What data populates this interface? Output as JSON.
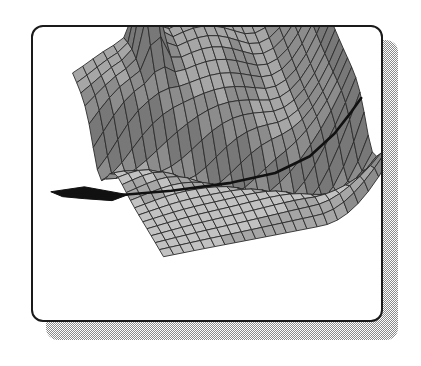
{
  "figure": {
    "kind": "3d-surface-mesh-plot",
    "frame": {
      "shape": "rounded-rectangle",
      "border_color": "#1a1a1a",
      "fill_color": "#ffffff",
      "shadow_color": "#8a8a8a",
      "corner_radius_px": 12
    },
    "canvas": {
      "width_px": 421,
      "height_px": 366
    }
  },
  "chart_data": {
    "type": "surface",
    "title": "",
    "subtitle": "",
    "xlabel": "",
    "ylabel": "",
    "zlabel": "",
    "grid": true,
    "legend": null,
    "axes_visible": false,
    "tick_labels": [],
    "colors": {
      "mesh_line": "#2b2b2b",
      "face_light": "#c2c2c2",
      "face_mid": "#a6a6a6",
      "face_shade": "#8c8c8c",
      "face_dark": "#787878",
      "fold_line": "#111111",
      "background": "#ffffff"
    },
    "projection": {
      "type": "axonometric",
      "rows": 22,
      "cols": 22
    },
    "annotations": [
      {
        "name": "sharp-spike",
        "description": "narrow tall peak on the left-centre ridge",
        "x_px": 182,
        "y_px": 60
      },
      {
        "name": "central-hump",
        "description": "broad rounded ridge crest",
        "x_px": 250,
        "y_px": 90
      },
      {
        "name": "diagonal-valley",
        "description": "dark fold running from lower-left to right",
        "x_px": 230,
        "y_px": 180
      },
      {
        "name": "right-wall",
        "description": "steeply rising surface panel on the right",
        "x_px": 330,
        "y_px": 110
      },
      {
        "name": "left-tail",
        "description": "thin dark spur protruding to the left",
        "x_px": 72,
        "y_px": 196
      }
    ],
    "x": [
      0,
      1,
      2,
      3,
      4,
      5,
      6,
      7,
      8,
      9,
      10,
      11,
      12,
      13,
      14,
      15,
      16,
      17,
      18,
      19,
      20,
      21,
      22
    ],
    "y": [
      0,
      1,
      2,
      3,
      4,
      5,
      6,
      7,
      8,
      9,
      10,
      11,
      12,
      13,
      14,
      15,
      16,
      17,
      18,
      19,
      20,
      21,
      22
    ],
    "zlim": [
      0,
      10
    ],
    "z_description": "Elevated plateau on the far (left/back) side with one narrow spike reaching the maximum, a broad crest in the middle-back, a deep creased valley crossing diagonally to the front-right, and a steep wall climbing at the right edge."
  }
}
